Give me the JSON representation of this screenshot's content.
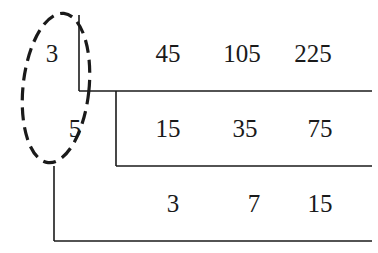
{
  "diagram": {
    "type": "short-division",
    "divisors": [
      "3",
      "5"
    ],
    "rows": [
      {
        "divisor": "3",
        "values": [
          "45",
          "105",
          "225"
        ]
      },
      {
        "divisor": "5",
        "values": [
          "15",
          "35",
          "75"
        ]
      },
      {
        "divisor": "",
        "values": [
          "3",
          "7",
          "15"
        ]
      }
    ],
    "highlight": {
      "shape": "dashed-ellipse",
      "encloses": [
        "3",
        "5"
      ]
    },
    "colors": {
      "ink": "#1a1a1a",
      "background": "#ffffff"
    }
  }
}
